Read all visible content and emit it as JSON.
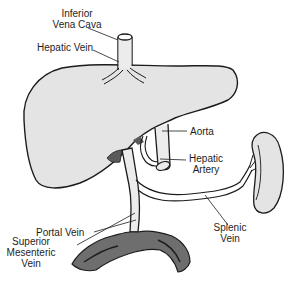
{
  "diagram": {
    "colors": {
      "organ_fill": "#e4e4e4",
      "vessel_fill": "#ececec",
      "intestine_fill": "#6e6e6e",
      "outline": "#1c1c1c",
      "background": "#ffffff"
    },
    "structures": [
      {
        "id": "liver",
        "label": null
      },
      {
        "id": "spleen",
        "label": null
      },
      {
        "id": "intestine",
        "label": null
      }
    ],
    "labels": {
      "ivc": {
        "line1": "Inferior",
        "line2": "Vena Cava"
      },
      "hepatic_vein": "Hepatic Vein",
      "aorta": "Aorta",
      "hepatic_artery": {
        "line1": "Hepatic",
        "line2": "Artery"
      },
      "portal_vein": "Portal Vein",
      "splenic_vein": {
        "line1": "Splenic",
        "line2": "Vein"
      },
      "smv": {
        "line1": "Superior",
        "line2": "Mesenteric",
        "line3": "Vein"
      }
    }
  }
}
